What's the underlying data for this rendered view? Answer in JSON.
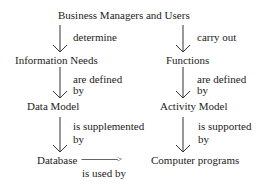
{
  "diagram": {
    "top_node": "Business Managers and Users",
    "left_column": {
      "nodes": [
        "Information Needs",
        "Data Model",
        "Database"
      ],
      "edge_labels": [
        {
          "line1": "determine",
          "line2": ""
        },
        {
          "line1": "are defined",
          "line2": "by"
        },
        {
          "line1": "is supplemented",
          "line2": "by"
        }
      ]
    },
    "right_column": {
      "nodes": [
        "Functions",
        "Activity Model",
        "Computer programs"
      ],
      "edge_labels": [
        {
          "line1": "carry out",
          "line2": ""
        },
        {
          "line1": "are defined",
          "line2": "by"
        },
        {
          "line1": "is supported",
          "line2": "by"
        }
      ]
    },
    "cross_edge": {
      "arrow_text": "------------------>",
      "label": "is used by"
    }
  }
}
